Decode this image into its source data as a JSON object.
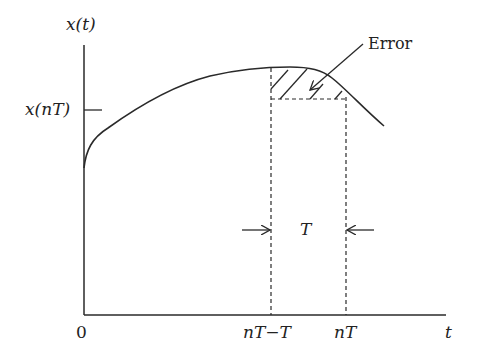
{
  "diagram": {
    "y_axis_label": "x(t)",
    "x_axis_label": "t",
    "y_tick_label": "x(nT)",
    "x_ticks": [
      {
        "label": "0"
      },
      {
        "label": "nT−T"
      },
      {
        "label": "nT"
      }
    ],
    "interval_label": "T",
    "error_label": "Error",
    "colors": {
      "stroke": "#2a2a2a",
      "background": "#ffffff"
    }
  }
}
